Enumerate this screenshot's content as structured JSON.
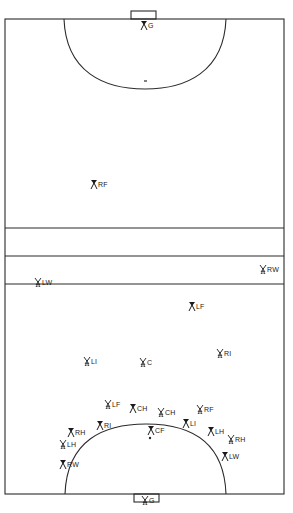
{
  "diagram": {
    "type": "field-hockey-formation",
    "colors": {
      "line": "#2a2a2a",
      "background": "#ffffff",
      "marker": "#1a1a1a"
    },
    "field": {
      "left": 5,
      "right": 284,
      "top": 19,
      "bottom": 494,
      "lines_y": [
        228,
        256,
        284
      ],
      "top_goal": {
        "x": 131,
        "y": 11,
        "w": 25,
        "h": 8
      },
      "bottom_goal": {
        "x": 134,
        "y": 494,
        "w": 25,
        "h": 8
      },
      "top_circle": {
        "x1": 64,
        "x2": 226,
        "apex_y": 89
      },
      "bottom_circle": {
        "x1": 65,
        "x2": 226,
        "apex_y": 424
      },
      "penalty_spot_top": {
        "x": 145,
        "y": 81
      },
      "penalty_spot_bottom": {
        "x": 150,
        "y": 438
      }
    },
    "players": [
      {
        "id": "top-g",
        "label": "G",
        "team": "dark",
        "x": 140,
        "y": 21
      },
      {
        "id": "top-rf",
        "label": "RF",
        "team": "dark",
        "x": 90,
        "y": 180
      },
      {
        "id": "rw-right",
        "label": "RW",
        "team": "light",
        "x": 259,
        "y": 265
      },
      {
        "id": "lw-left",
        "label": "LW",
        "team": "light",
        "x": 34,
        "y": 278
      },
      {
        "id": "lf",
        "label": "LF",
        "team": "dark",
        "x": 188,
        "y": 302
      },
      {
        "id": "li",
        "label": "LI",
        "team": "light",
        "x": 83,
        "y": 357
      },
      {
        "id": "c",
        "label": "C",
        "team": "light",
        "x": 139,
        "y": 358
      },
      {
        "id": "ri",
        "label": "RI",
        "team": "light",
        "x": 216,
        "y": 349
      },
      {
        "id": "lf-2",
        "label": "LF",
        "team": "light",
        "x": 104,
        "y": 400
      },
      {
        "id": "ch-dark",
        "label": "CH",
        "team": "dark",
        "x": 129,
        "y": 404
      },
      {
        "id": "ch-light",
        "label": "CH",
        "team": "light",
        "x": 157,
        "y": 408
      },
      {
        "id": "rf-2",
        "label": "RF",
        "team": "light",
        "x": 196,
        "y": 405
      },
      {
        "id": "ri-2",
        "label": "RI",
        "team": "dark",
        "x": 96,
        "y": 421
      },
      {
        "id": "cf",
        "label": "CF",
        "team": "dark",
        "x": 147,
        "y": 426
      },
      {
        "id": "li-2",
        "label": "LI",
        "team": "dark",
        "x": 182,
        "y": 419
      },
      {
        "id": "rh-left",
        "label": "RH",
        "team": "dark",
        "x": 67,
        "y": 428
      },
      {
        "id": "lh-right",
        "label": "LH",
        "team": "dark",
        "x": 207,
        "y": 427
      },
      {
        "id": "lh-left",
        "label": "LH",
        "team": "light",
        "x": 59,
        "y": 440
      },
      {
        "id": "rh-right",
        "label": "RH",
        "team": "light",
        "x": 227,
        "y": 435
      },
      {
        "id": "rw-left",
        "label": "RW",
        "team": "dark",
        "x": 59,
        "y": 460
      },
      {
        "id": "lw-right",
        "label": "LW",
        "team": "dark",
        "x": 221,
        "y": 452
      },
      {
        "id": "bottom-g",
        "label": "G",
        "team": "light",
        "x": 141,
        "y": 496
      }
    ]
  }
}
